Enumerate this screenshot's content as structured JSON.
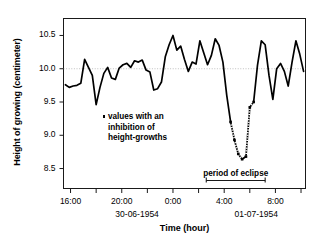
{
  "chart_data": {
    "type": "line",
    "title": "",
    "xlabel": "Time (hour)",
    "ylabel": "Height of growing (centimeter)",
    "ylim": [
      8.2,
      10.75
    ],
    "xlim": [
      15.5,
      10.3
    ],
    "grid": false,
    "legend_position": "none",
    "yticks": [
      "10.5",
      "10.0",
      "9.5",
      "9.0",
      "8.5"
    ],
    "ytick_values": [
      10.5,
      10.0,
      9.5,
      9.0,
      8.5
    ],
    "xticks": [
      "16:00",
      "20:00",
      "0:00",
      "4:00",
      "8:00"
    ],
    "xtick_values": [
      16,
      20,
      24,
      28,
      32
    ],
    "xminor_values": [
      18,
      22,
      26,
      30,
      34
    ],
    "date_labels": [
      {
        "text": "30-06-1954",
        "x": 21.2
      },
      {
        "text": "01-07-1954",
        "x": 30.5
      }
    ],
    "reference_line": {
      "y": 10.0,
      "style": "dotted",
      "color": "#b0b0b0"
    },
    "eclipse_bar": {
      "x_start": 26.6,
      "x_end": 31.2,
      "label": "period of eclipse"
    },
    "annotations": [
      {
        "text": "values with an",
        "bullet": true
      },
      {
        "text": "inhibition of",
        "bullet": false
      },
      {
        "text": "height-growths",
        "bullet": false
      }
    ],
    "series": [
      {
        "name": "height of growing",
        "color": "#000000",
        "x": [
          15.6,
          15.9,
          16.2,
          16.5,
          16.8,
          17.1,
          17.4,
          17.7,
          18.0,
          18.3,
          18.6,
          18.9,
          19.2,
          19.5,
          19.8,
          20.1,
          20.4,
          20.7,
          21.0,
          21.3,
          21.6,
          21.9,
          22.2,
          22.5,
          22.8,
          23.1,
          23.4,
          23.7,
          24.0,
          24.3,
          24.6,
          24.9,
          25.2,
          25.5,
          25.8,
          26.1,
          26.4,
          26.7,
          27.0,
          27.3,
          27.6,
          27.9,
          28.2,
          28.5,
          28.8,
          29.1,
          29.4,
          29.7,
          30.0,
          30.3,
          30.6,
          30.9,
          31.2,
          31.5,
          31.8,
          32.1,
          32.4,
          32.7,
          33.0,
          33.3,
          33.6,
          33.9,
          34.2
        ],
        "y": [
          9.76,
          9.72,
          9.74,
          9.75,
          9.78,
          10.14,
          10.02,
          9.9,
          9.46,
          9.72,
          9.93,
          10.02,
          9.86,
          9.84,
          10.01,
          10.06,
          10.08,
          10.02,
          10.12,
          10.1,
          10.13,
          9.98,
          9.95,
          9.68,
          9.7,
          9.8,
          10.18,
          10.36,
          10.5,
          10.28,
          10.34,
          10.14,
          9.96,
          10.1,
          10.07,
          10.42,
          10.24,
          10.06,
          10.2,
          10.45,
          10.35,
          10.1,
          9.6,
          9.2,
          8.93,
          8.72,
          8.64,
          8.68,
          9.42,
          9.5,
          10.05,
          10.42,
          10.36,
          9.9,
          9.54,
          10.0,
          10.08,
          9.96,
          9.74,
          10.1,
          10.42,
          10.22,
          9.96
        ]
      }
    ],
    "inhibited_points": {
      "description": "values with an inhibition of height-growths",
      "marker": "square-dotted",
      "segments": [
        {
          "x": [
            28.5,
            28.8,
            29.1,
            29.4
          ],
          "y": [
            9.2,
            8.93,
            8.72,
            8.64
          ]
        },
        {
          "x": [
            29.7,
            30.0,
            30.3
          ],
          "y": [
            8.68,
            9.42,
            9.5
          ]
        }
      ]
    }
  },
  "axes": {
    "y_title": "Height of growing (centimeter)",
    "x_title": "Time (hour)"
  }
}
